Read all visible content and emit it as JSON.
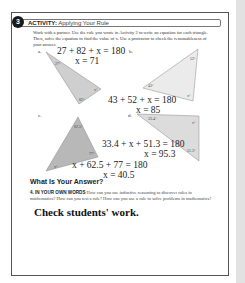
{
  "activity": {
    "number": "3",
    "title_bold": "ACTIVITY:",
    "title_rest": "Applying Your Rule"
  },
  "instructions": "Work with a partner. Use the rule you wrote in Activity 2 to write an equation for each triangle. Then, solve the equation to find the value of x. Use a protractor to check the reasonableness of your answer.",
  "parts": [
    {
      "label": "a.",
      "angles": [
        "27°",
        "82°",
        "x°"
      ],
      "equation": "27 + 82 + x = 180",
      "solution": "x = 71"
    },
    {
      "label": "b.",
      "angles": [
        "52°",
        "43°",
        "x°"
      ],
      "equation": "43 + 52 + x = 180",
      "solution": "x = 85"
    },
    {
      "label": "c.",
      "angles": [
        "62.5°",
        "77°",
        "x°"
      ],
      "equation": "x + 62.5 + 77 = 180",
      "solution": "x = 40.5"
    },
    {
      "label": "d.",
      "angles": [
        "33.4°",
        "x°",
        "51.3°"
      ],
      "equation": "33.4 + x + 51.3 = 180",
      "solution": "x = 95.3"
    }
  ],
  "what_is_your_answer": "What Is Your Answer?",
  "question4": {
    "number": "4.",
    "heading": "IN YOUR OWN WORDS",
    "text": "How can you use inductive reasoning to discover rules in mathematics? How can you test a rule? How can you use a rule to solve problems in mathematics?"
  },
  "answer": "Check students' work."
}
